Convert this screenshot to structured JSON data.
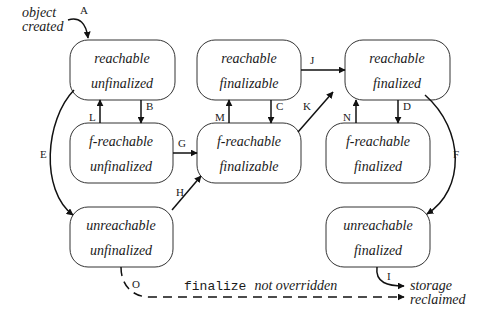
{
  "diagram": {
    "states": [
      {
        "id": "s1",
        "line1": "reachable",
        "line2": "unfinalized"
      },
      {
        "id": "s2",
        "line1": "reachable",
        "line2": "finalizable"
      },
      {
        "id": "s3",
        "line1": "reachable",
        "line2": "finalized"
      },
      {
        "id": "s4",
        "line1": "f-reachable",
        "line2": "unfinalized"
      },
      {
        "id": "s5",
        "line1": "f-reachable",
        "line2": "finalizable"
      },
      {
        "id": "s6",
        "line1": "f-reachable",
        "line2": "finalized"
      },
      {
        "id": "s7",
        "line1": "unreachable",
        "line2": "unfinalized"
      },
      {
        "id": "s8",
        "line1": "unreachable",
        "line2": "finalized"
      }
    ],
    "transitions": {
      "A": "A",
      "B": "B",
      "C": "C",
      "D": "D",
      "E": "E",
      "F": "F",
      "G": "G",
      "H": "H",
      "I": "I",
      "J": "J",
      "K": "K",
      "L": "L",
      "M": "M",
      "N": "N",
      "O": "O"
    },
    "start_note": {
      "line1": "object",
      "line2": "created"
    },
    "end_note": {
      "line1": "storage",
      "line2": "reclaimed"
    },
    "dashed_note": {
      "code": "finalize",
      "text": "not overridden"
    }
  }
}
